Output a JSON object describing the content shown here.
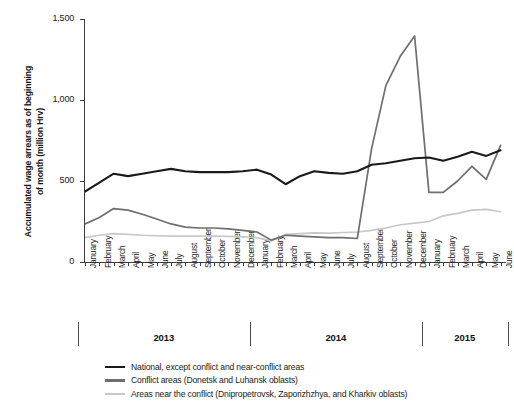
{
  "chart_data": {
    "type": "line",
    "title": "",
    "xlabel": "",
    "ylabel": "Accumulated wage arrears as of beginning\nof month (million Hrv)",
    "ylim": [
      0,
      1500
    ],
    "yticks": [
      0,
      500,
      1000,
      1500
    ],
    "ytick_labels": [
      "0",
      "500",
      "1,000",
      "1,500"
    ],
    "grid": false,
    "legend_position": "bottom-left",
    "x": [
      "January",
      "February",
      "March",
      "April",
      "May",
      "June",
      "July",
      "August",
      "September",
      "October",
      "November",
      "December",
      "January",
      "February",
      "March",
      "April",
      "May",
      "June",
      "July",
      "August",
      "September",
      "October",
      "November",
      "December",
      "January",
      "February",
      "March",
      "April",
      "May",
      "June"
    ],
    "year_groups": [
      {
        "label": "2013",
        "start_index": 0,
        "end_index": 11
      },
      {
        "label": "2014",
        "start_index": 12,
        "end_index": 23
      },
      {
        "label": "2015",
        "start_index": 24,
        "end_index": 29
      }
    ],
    "series": [
      {
        "name": "National, except conflict and near-conflict areas",
        "color": "#1a1a1a",
        "values": [
          435,
          490,
          545,
          530,
          545,
          560,
          575,
          560,
          555,
          555,
          555,
          560,
          570,
          540,
          480,
          530,
          560,
          550,
          545,
          560,
          600,
          610,
          625,
          640,
          645,
          625,
          650,
          680,
          655,
          690
        ]
      },
      {
        "name": "Conflict areas (Donetsk and Luhansk oblasts)",
        "color": "#6e6e6e",
        "values": [
          235,
          275,
          330,
          320,
          295,
          265,
          235,
          215,
          210,
          210,
          205,
          195,
          185,
          135,
          165,
          160,
          155,
          150,
          150,
          145,
          700,
          1090,
          1270,
          1395,
          430,
          430,
          500,
          590,
          510,
          720
        ]
      },
      {
        "name": "Areas near the conflict (Dnipropetrovsk, Zaporizhzhya, and Kharkiv oblasts)",
        "color": "#c8c8c8",
        "values": [
          150,
          165,
          175,
          170,
          165,
          162,
          160,
          160,
          160,
          160,
          158,
          155,
          150,
          130,
          170,
          175,
          180,
          178,
          182,
          185,
          195,
          210,
          230,
          240,
          250,
          285,
          300,
          320,
          325,
          310
        ]
      }
    ]
  },
  "legend": {
    "items": [
      {
        "label": "National, except conflict and near-conflict areas",
        "color": "#1a1a1a"
      },
      {
        "label": "Conflict areas (Donetsk and Luhansk oblasts)",
        "color": "#6e6e6e"
      },
      {
        "label": "Areas near the conflict (Dnipropetrovsk, Zaporizhzhya, and Kharkiv oblasts)",
        "color": "#c8c8c8"
      }
    ]
  }
}
